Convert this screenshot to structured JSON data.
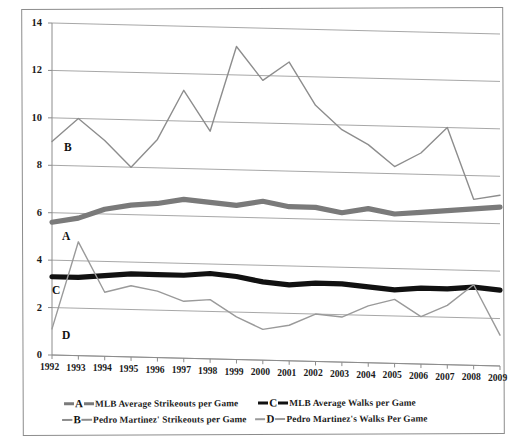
{
  "chart_data": {
    "type": "line",
    "title": "",
    "xlabel": "",
    "ylabel": "",
    "x": [
      1992,
      1993,
      1994,
      1995,
      1996,
      1997,
      1998,
      1999,
      2000,
      2001,
      2002,
      2003,
      2004,
      2005,
      2006,
      2007,
      2008,
      2009
    ],
    "categories": [
      "1992",
      "1993",
      "1994",
      "1995",
      "1996",
      "1997",
      "1998",
      "1999",
      "2000",
      "2001",
      "2002",
      "2003",
      "2004",
      "2005",
      "2006",
      "2007",
      "2008",
      "2009"
    ],
    "ylim": [
      0,
      14
    ],
    "yticks": [
      0,
      2,
      4,
      6,
      8,
      10,
      12,
      14
    ],
    "grid": true,
    "legend_position": "bottom",
    "series": [
      {
        "name": "MLB Average Strikeouts per Game",
        "key": "A",
        "color": "#7a7a7a",
        "width": 5.2,
        "values": [
          5.6,
          5.8,
          6.2,
          6.4,
          6.5,
          6.7,
          6.6,
          6.5,
          6.7,
          6.5,
          6.5,
          6.3,
          6.5,
          6.3,
          6.4,
          6.5,
          6.6,
          6.7
        ]
      },
      {
        "name": "Pedro Martinez' Strikeouts per Game",
        "key": "B",
        "color": "#8d8d8d",
        "width": 1.4,
        "values": [
          9.0,
          10.0,
          9.1,
          8.0,
          9.2,
          11.3,
          9.6,
          13.2,
          11.8,
          12.6,
          10.8,
          9.8,
          9.2,
          8.3,
          8.9,
          10.0,
          7.0,
          7.2
        ]
      },
      {
        "name": "MLB Average Walks per Game",
        "key": "C",
        "color": "#111111",
        "width": 5.2,
        "values": [
          3.3,
          3.3,
          3.4,
          3.5,
          3.5,
          3.5,
          3.6,
          3.5,
          3.3,
          3.2,
          3.3,
          3.3,
          3.2,
          3.1,
          3.2,
          3.2,
          3.3,
          3.2
        ]
      },
      {
        "name": "Pedro Martinez's Walks Per Game",
        "key": "D",
        "color": "#9a9a9a",
        "width": 1.4,
        "values": [
          1.1,
          4.8,
          2.7,
          3.0,
          2.8,
          2.4,
          2.5,
          1.8,
          1.3,
          1.5,
          2.0,
          1.9,
          2.4,
          2.7,
          2.0,
          2.5,
          3.4,
          1.3
        ]
      }
    ]
  },
  "legend": {
    "rows": [
      [
        {
          "marker": "A",
          "style": "thick",
          "color": "#7a7a7a",
          "label": "MLB Average Strikeouts per Game"
        },
        {
          "marker": "C",
          "style": "thick",
          "color": "#111111",
          "label": "MLB Average Walks per Game"
        }
      ],
      [
        {
          "marker": "B",
          "style": "thin",
          "color": "#8d8d8d",
          "label": "Pedro Martinez' Strikeouts per Game"
        },
        {
          "marker": "D",
          "style": "thin",
          "color": "#9a9a9a",
          "label": "Pedro Martinez's Walks Per Game"
        }
      ]
    ]
  },
  "annotations": [
    {
      "letter": "B",
      "x": 64,
      "y": 142
    },
    {
      "letter": "A",
      "x": 62,
      "y": 231
    },
    {
      "letter": "C",
      "x": 52,
      "y": 285
    },
    {
      "letter": "D",
      "x": 62,
      "y": 330
    }
  ]
}
